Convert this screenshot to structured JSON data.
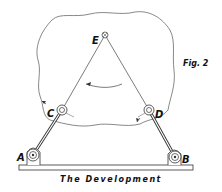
{
  "figure": {
    "label": "Fig. 2",
    "caption": "The  Development"
  },
  "points": [
    {
      "id": "A",
      "label": "A",
      "x": 31,
      "y": 155,
      "role": "fixed pivot"
    },
    {
      "id": "B",
      "label": "B",
      "x": 175,
      "y": 157,
      "role": "fixed pivot"
    },
    {
      "id": "C",
      "label": "C",
      "x": 62,
      "y": 110,
      "role": "moving joint"
    },
    {
      "id": "D",
      "label": "D",
      "x": 149,
      "y": 110,
      "role": "moving joint"
    },
    {
      "id": "E",
      "label": "E",
      "x": 105,
      "y": 35,
      "role": "apex joint"
    }
  ],
  "links": [
    {
      "from": "A",
      "to": "C",
      "style": "solid bar"
    },
    {
      "from": "B",
      "to": "D",
      "style": "solid bar"
    },
    {
      "from": "C",
      "to": "E",
      "style": "thin line"
    },
    {
      "from": "D",
      "to": "E",
      "style": "thin line"
    }
  ],
  "annotations": {
    "rotation_arrow": "curved arrow between CE and DE",
    "base": "ground bar along bottom",
    "blob": "irregular outline enclosing E, C, D"
  },
  "colors": {
    "ink": "#222222",
    "background": "#ffffff"
  }
}
